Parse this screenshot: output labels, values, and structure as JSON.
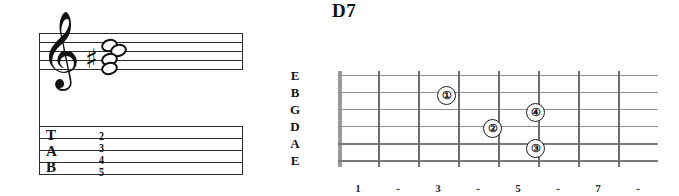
{
  "chord": {
    "title": "D7"
  },
  "notation": {
    "clef_glyph": "𝄞",
    "clef_name": "treble-clef",
    "accidental_glyph": "♯",
    "accidental_name": "sharp",
    "tab_letters": [
      "T",
      "A",
      "B"
    ],
    "tab_numbers": [
      "2",
      "3",
      "4",
      "5"
    ]
  },
  "fretboard": {
    "string_labels": [
      "E",
      "B",
      "G",
      "D",
      "A",
      "E"
    ],
    "fret_labels": [
      "1",
      "-",
      "3",
      "-",
      "5",
      "-",
      "7",
      "-"
    ],
    "fingers": [
      {
        "label": "①",
        "number": "1"
      },
      {
        "label": "②",
        "number": "2"
      },
      {
        "label": "③",
        "number": "3"
      },
      {
        "label": "④",
        "number": "4"
      }
    ]
  },
  "colors": {
    "ink": "#141414",
    "string": "#8e8e8e",
    "fret": "#6e6e6e",
    "nut": "#9a9a9a"
  }
}
